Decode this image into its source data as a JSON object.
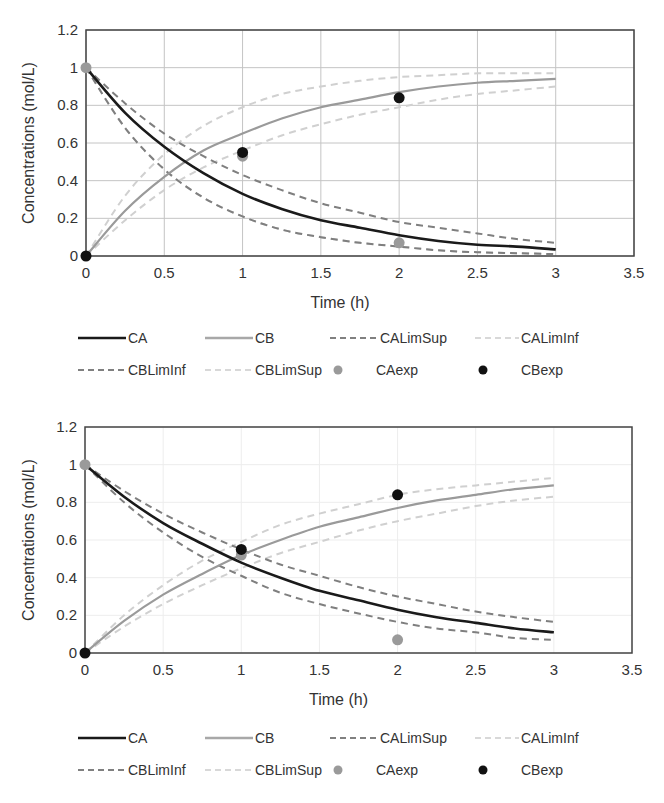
{
  "chart_data": [
    {
      "type": "line",
      "title": "",
      "xlabel": "Time (h)",
      "ylabel": "Concentrations (mol/L)",
      "xlim": [
        0,
        3.5
      ],
      "ylim": [
        0,
        1.2
      ],
      "xticks": [
        "0",
        "0.5",
        "1",
        "1.5",
        "2",
        "2.5",
        "3",
        "3.5"
      ],
      "yticks": [
        "0",
        "0.2",
        "0.4",
        "0.6",
        "0.8",
        "1",
        "1.2"
      ],
      "grid": true,
      "legend_position": "bottom",
      "x": [
        0,
        0.25,
        0.5,
        0.75,
        1,
        1.25,
        1.5,
        1.75,
        2,
        2.25,
        2.5,
        2.75,
        3
      ],
      "series": [
        {
          "name": "CA",
          "style": "solid",
          "color": "#1a1a1a",
          "values": [
            1,
            0.76,
            0.58,
            0.44,
            0.33,
            0.25,
            0.19,
            0.15,
            0.11,
            0.08,
            0.06,
            0.05,
            0.035
          ]
        },
        {
          "name": "CB",
          "style": "solid",
          "color": "#9a9a9a",
          "values": [
            0,
            0.24,
            0.42,
            0.56,
            0.65,
            0.73,
            0.79,
            0.83,
            0.87,
            0.9,
            0.92,
            0.93,
            0.94
          ]
        },
        {
          "name": "CALimSup",
          "style": "dashed",
          "color": "#7f7f7f",
          "values": [
            1,
            0.81,
            0.65,
            0.53,
            0.43,
            0.35,
            0.28,
            0.23,
            0.18,
            0.15,
            0.12,
            0.09,
            0.07
          ]
        },
        {
          "name": "CALimInf",
          "style": "dashed",
          "color": "#d0d0d0",
          "values": [
            1,
            0.68,
            0.46,
            0.31,
            0.21,
            0.14,
            0.1,
            0.07,
            0.05,
            0.03,
            0.02,
            0.015,
            0.01
          ]
        },
        {
          "name": "CBLimInf",
          "style": "dashed",
          "color": "#7f7f7f",
          "values": [
            1,
            0.68,
            0.46,
            0.31,
            0.21,
            0.14,
            0.1,
            0.07,
            0.05,
            0.03,
            0.02,
            0.015,
            0.01
          ]
        },
        {
          "name": "CBLimSup",
          "style": "dashed",
          "color": "#d0d0d0",
          "values": [
            0,
            0.32,
            0.54,
            0.69,
            0.79,
            0.86,
            0.9,
            0.93,
            0.95,
            0.96,
            0.97,
            0.97,
            0.97
          ]
        },
        {
          "name": "CBLimInfB",
          "style": "dashed",
          "color": "#d0d0d0",
          "values": [
            0,
            0.19,
            0.35,
            0.47,
            0.56,
            0.64,
            0.7,
            0.75,
            0.79,
            0.83,
            0.86,
            0.88,
            0.9
          ]
        }
      ],
      "points": [
        {
          "name": "CAexp",
          "color": "#9a9a9a",
          "x": [
            0,
            1,
            2
          ],
          "y": [
            1,
            0.53,
            0.07
          ]
        },
        {
          "name": "CBexp",
          "color": "#111111",
          "x": [
            0,
            1,
            2
          ],
          "y": [
            0,
            0.55,
            0.84
          ]
        }
      ]
    },
    {
      "type": "line",
      "title": "",
      "xlabel": "Time (h)",
      "ylabel": "Concentrations (mol/L)",
      "xlim": [
        0,
        3.5
      ],
      "ylim": [
        0,
        1.2
      ],
      "xticks": [
        "0",
        "0.5",
        "1",
        "1.5",
        "2",
        "2.5",
        "3",
        "3.5"
      ],
      "yticks": [
        "0",
        "0.2",
        "0.4",
        "0.6",
        "0.8",
        "1",
        "1.2"
      ],
      "grid": true,
      "legend_position": "bottom",
      "x": [
        0,
        0.25,
        0.5,
        0.75,
        1,
        1.25,
        1.5,
        1.75,
        2,
        2.25,
        2.5,
        2.75,
        3
      ],
      "series": [
        {
          "name": "CA",
          "style": "solid",
          "color": "#1a1a1a",
          "values": [
            1,
            0.83,
            0.69,
            0.58,
            0.48,
            0.4,
            0.33,
            0.28,
            0.23,
            0.19,
            0.16,
            0.13,
            0.11
          ]
        },
        {
          "name": "CB",
          "style": "solid",
          "color": "#9a9a9a",
          "values": [
            0,
            0.17,
            0.31,
            0.42,
            0.52,
            0.6,
            0.67,
            0.72,
            0.77,
            0.81,
            0.84,
            0.87,
            0.89
          ]
        },
        {
          "name": "CALimSup",
          "style": "dashed",
          "color": "#7f7f7f",
          "values": [
            1,
            0.86,
            0.74,
            0.64,
            0.55,
            0.47,
            0.41,
            0.35,
            0.3,
            0.26,
            0.22,
            0.19,
            0.165
          ]
        },
        {
          "name": "CALimInf",
          "style": "dashed",
          "color": "#7f7f7f",
          "values": [
            1,
            0.8,
            0.64,
            0.51,
            0.41,
            0.32,
            0.26,
            0.21,
            0.165,
            0.13,
            0.11,
            0.08,
            0.07
          ]
        },
        {
          "name": "CBLimInf",
          "style": "dashed",
          "color": "#d0d0d0",
          "values": [
            0,
            0.14,
            0.26,
            0.36,
            0.45,
            0.53,
            0.59,
            0.65,
            0.7,
            0.74,
            0.78,
            0.81,
            0.83
          ]
        },
        {
          "name": "CBLimSup",
          "style": "dashed",
          "color": "#d0d0d0",
          "values": [
            0,
            0.2,
            0.36,
            0.49,
            0.59,
            0.68,
            0.74,
            0.79,
            0.84,
            0.87,
            0.89,
            0.91,
            0.93
          ]
        }
      ],
      "points": [
        {
          "name": "CAexp",
          "color": "#9a9a9a",
          "x": [
            0,
            1,
            2
          ],
          "y": [
            1,
            0.52,
            0.07
          ]
        },
        {
          "name": "CBexp",
          "color": "#111111",
          "x": [
            0,
            1,
            2
          ],
          "y": [
            0,
            0.55,
            0.84
          ]
        }
      ]
    }
  ],
  "legend": {
    "items": [
      {
        "label": "CA",
        "kind": "solid",
        "color": "#1a1a1a"
      },
      {
        "label": "CB",
        "kind": "solid",
        "color": "#a8a8a8"
      },
      {
        "label": "CALimSup",
        "kind": "dashed",
        "color": "#808080"
      },
      {
        "label": "CALimInf",
        "kind": "dashed",
        "color": "#d8d8d8"
      },
      {
        "label": "CBLimInf",
        "kind": "dashed",
        "color": "#808080"
      },
      {
        "label": "CBLimSup",
        "kind": "dashed",
        "color": "#d8d8d8"
      },
      {
        "label": "CAexp",
        "kind": "marker",
        "color": "#9a9a9a"
      },
      {
        "label": "CBexp",
        "kind": "marker",
        "color": "#111111"
      }
    ]
  }
}
